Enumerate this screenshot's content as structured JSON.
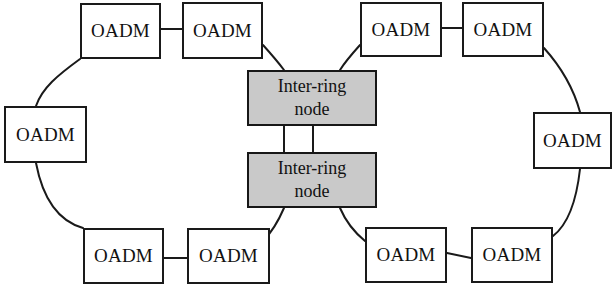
{
  "diagram": {
    "type": "network-topology",
    "canvas": {
      "width": 615,
      "height": 292,
      "background": "#ffffff"
    },
    "styles": {
      "oadm_fill": "#ffffff",
      "inter_ring_fill": "#c9c9c9",
      "stroke": "#1a1a1a",
      "stroke_width": 2
    },
    "nodes": [
      {
        "id": "oadm-left-top-1",
        "label": "OADM",
        "kind": "oadm",
        "x": 80,
        "y": 3,
        "w": 81,
        "h": 56
      },
      {
        "id": "oadm-left-top-2",
        "label": "OADM",
        "kind": "oadm",
        "x": 182,
        "y": 2,
        "w": 81,
        "h": 57
      },
      {
        "id": "oadm-left-mid",
        "label": "OADM",
        "kind": "oadm",
        "x": 4,
        "y": 106,
        "w": 83,
        "h": 57
      },
      {
        "id": "oadm-left-bottom-1",
        "label": "OADM",
        "kind": "oadm",
        "x": 83,
        "y": 228,
        "w": 81,
        "h": 56
      },
      {
        "id": "oadm-left-bottom-2",
        "label": "OADM",
        "kind": "oadm",
        "x": 187,
        "y": 228,
        "w": 83,
        "h": 56
      },
      {
        "id": "oadm-right-top-1",
        "label": "OADM",
        "kind": "oadm",
        "x": 360,
        "y": 2,
        "w": 82,
        "h": 55
      },
      {
        "id": "oadm-right-top-2",
        "label": "OADM",
        "kind": "oadm",
        "x": 462,
        "y": 2,
        "w": 82,
        "h": 55
      },
      {
        "id": "oadm-right-mid",
        "label": "OADM",
        "kind": "oadm",
        "x": 533,
        "y": 112,
        "w": 79,
        "h": 57
      },
      {
        "id": "oadm-right-bottom-1",
        "label": "OADM",
        "kind": "oadm",
        "x": 365,
        "y": 227,
        "w": 82,
        "h": 56
      },
      {
        "id": "oadm-right-bottom-2",
        "label": "OADM",
        "kind": "oadm",
        "x": 471,
        "y": 227,
        "w": 82,
        "h": 56
      },
      {
        "id": "inter-ring-top",
        "label": "Inter-ring node",
        "label_line1": "Inter-ring",
        "label_line2": "node",
        "kind": "inter-ring",
        "x": 247,
        "y": 70,
        "w": 130,
        "h": 56
      },
      {
        "id": "inter-ring-bottom",
        "label": "Inter-ring node",
        "label_line1": "Inter-ring",
        "label_line2": "node",
        "kind": "inter-ring",
        "x": 247,
        "y": 152,
        "w": 130,
        "h": 56
      }
    ],
    "links": [
      {
        "id": "link-left-top-pair",
        "from": "oadm-left-top-1",
        "to": "oadm-left-top-2",
        "shape": "straight",
        "d": "M 161 29 L 182 29"
      },
      {
        "id": "link-left-upper-arc",
        "from": "oadm-left-top-1",
        "to": "oadm-left-mid",
        "shape": "arc",
        "d": "M 80 59 C 58 75 42 88 36 106"
      },
      {
        "id": "link-left-lower-arc",
        "from": "oadm-left-mid",
        "to": "oadm-left-bottom-1",
        "shape": "arc",
        "d": "M 36 163 C 44 205 62 222 83 228"
      },
      {
        "id": "link-left-bottom-pair",
        "from": "oadm-left-bottom-1",
        "to": "oadm-left-bottom-2",
        "shape": "straight",
        "d": "M 164 258 L 187 258"
      },
      {
        "id": "link-top-left-to-interring",
        "from": "oadm-left-top-2",
        "to": "inter-ring-top",
        "shape": "arc",
        "d": "M 263 45 C 272 55 278 62 284 70"
      },
      {
        "id": "link-bottom-left-to-interring",
        "from": "inter-ring-bottom",
        "to": "oadm-left-bottom-2",
        "shape": "arc",
        "d": "M 284 208 C 278 222 272 232 263 241"
      },
      {
        "id": "link-interring-a",
        "from": "inter-ring-top",
        "to": "inter-ring-bottom",
        "shape": "straight",
        "d": "M 284 126 L 284 152"
      },
      {
        "id": "link-interring-b",
        "from": "inter-ring-top",
        "to": "inter-ring-bottom",
        "shape": "straight",
        "d": "M 313 126 L 313 152"
      },
      {
        "id": "link-top-right-to-interring",
        "from": "oadm-right-top-1",
        "to": "inter-ring-top",
        "shape": "arc",
        "d": "M 360 45 C 351 55 345 62 340 70"
      },
      {
        "id": "link-bottom-right-to-interring",
        "from": "inter-ring-bottom",
        "to": "oadm-right-bottom-1",
        "shape": "arc",
        "d": "M 340 208 C 346 222 354 232 365 241"
      },
      {
        "id": "link-right-top-pair",
        "from": "oadm-right-top-1",
        "to": "oadm-right-top-2",
        "shape": "straight",
        "d": "M 442 28 L 462 28"
      },
      {
        "id": "link-right-upper-arc",
        "from": "oadm-right-top-2",
        "to": "oadm-right-mid",
        "shape": "arc",
        "d": "M 544 48 C 562 68 574 90 580 112"
      },
      {
        "id": "link-right-lower-arc",
        "from": "oadm-right-mid",
        "to": "oadm-right-bottom-2",
        "shape": "arc",
        "d": "M 580 169 C 576 205 566 226 553 236"
      },
      {
        "id": "link-right-bottom-pair",
        "from": "oadm-right-bottom-1",
        "to": "oadm-right-bottom-2",
        "shape": "straight",
        "d": "M 447 253 L 471 258"
      }
    ]
  }
}
